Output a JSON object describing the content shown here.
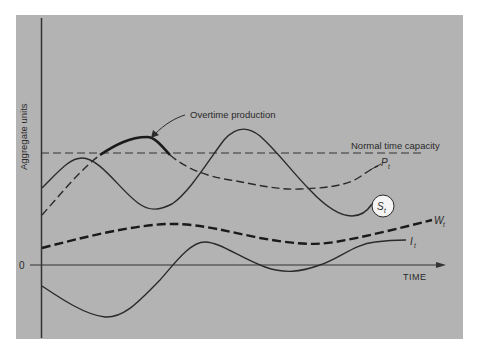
{
  "figure": {
    "type": "conceptual time-series diagram",
    "y_axis_label": "Aggregate units",
    "x_axis_label": "TIME",
    "origin_label": "0",
    "annotations": {
      "overtime": "Overtime production",
      "capacity": "Normal time capacity"
    },
    "series": [
      {
        "id": "P",
        "label": "P",
        "subscript": "t",
        "style": "dashed",
        "description": "Production"
      },
      {
        "id": "S",
        "label": "S",
        "subscript": "t",
        "style": "solid",
        "description": "Sales (circled label)"
      },
      {
        "id": "W",
        "label": "W",
        "subscript": "t",
        "style": "heavy-dashed",
        "description": "Workforce"
      },
      {
        "id": "I",
        "label": "I",
        "subscript": "t",
        "style": "solid",
        "description": "Inventory"
      }
    ],
    "colors": {
      "background": "#b3b3b3",
      "ink": "#2a2a2a",
      "page": "#ffffff"
    }
  }
}
